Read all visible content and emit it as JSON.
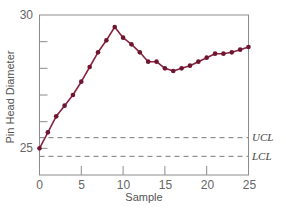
{
  "chart_data": {
    "type": "line",
    "title": "",
    "xlabel": "Sample",
    "ylabel": "Pin Head Diameter",
    "xlim": [
      0,
      25
    ],
    "ylim": [
      24,
      30
    ],
    "x_ticks": [
      0,
      5,
      10,
      15,
      20,
      25
    ],
    "y_tick_positions": [
      25,
      26,
      27,
      28,
      29,
      30
    ],
    "y_tick_labels": [
      {
        "value": 25,
        "label": "25"
      },
      {
        "value": 30,
        "label": "30"
      }
    ],
    "grid": false,
    "legend": null,
    "series": [
      {
        "name": "Pin Head Diameter",
        "color": "#8a2340",
        "marker": "circle",
        "x": [
          0,
          1,
          2,
          3,
          4,
          5,
          6,
          7,
          8,
          9,
          10,
          11,
          12,
          13,
          14,
          15,
          16,
          17,
          18,
          19,
          20,
          21,
          22,
          23,
          24,
          25
        ],
        "values": [
          25.0,
          25.6,
          26.2,
          26.6,
          27.0,
          27.5,
          28.05,
          28.6,
          29.05,
          29.55,
          29.15,
          28.9,
          28.6,
          28.25,
          28.25,
          28.0,
          27.9,
          28.0,
          28.1,
          28.25,
          28.4,
          28.55,
          28.55,
          28.6,
          28.7,
          28.8
        ]
      }
    ],
    "reference_lines": [
      {
        "name": "UCL",
        "label": "UCL",
        "value": 25.4,
        "style": "dashed",
        "color": "#777777"
      },
      {
        "name": "LCL",
        "label": "LCL",
        "value": 24.7,
        "style": "dashed",
        "color": "#777777"
      }
    ],
    "colors": {
      "line": "#8a2340",
      "marker": "#6e1530",
      "axis": "#8c8c8c",
      "limit": "#7a7a7a"
    }
  },
  "labels": {
    "xlabel": "Sample",
    "ylabel": "Pin Head Diameter",
    "y_top": "30",
    "y_bottom": "25",
    "ucl": "UCL",
    "lcl": "LCL",
    "x_ticks": [
      "0",
      "5",
      "10",
      "15",
      "20",
      "25"
    ]
  }
}
